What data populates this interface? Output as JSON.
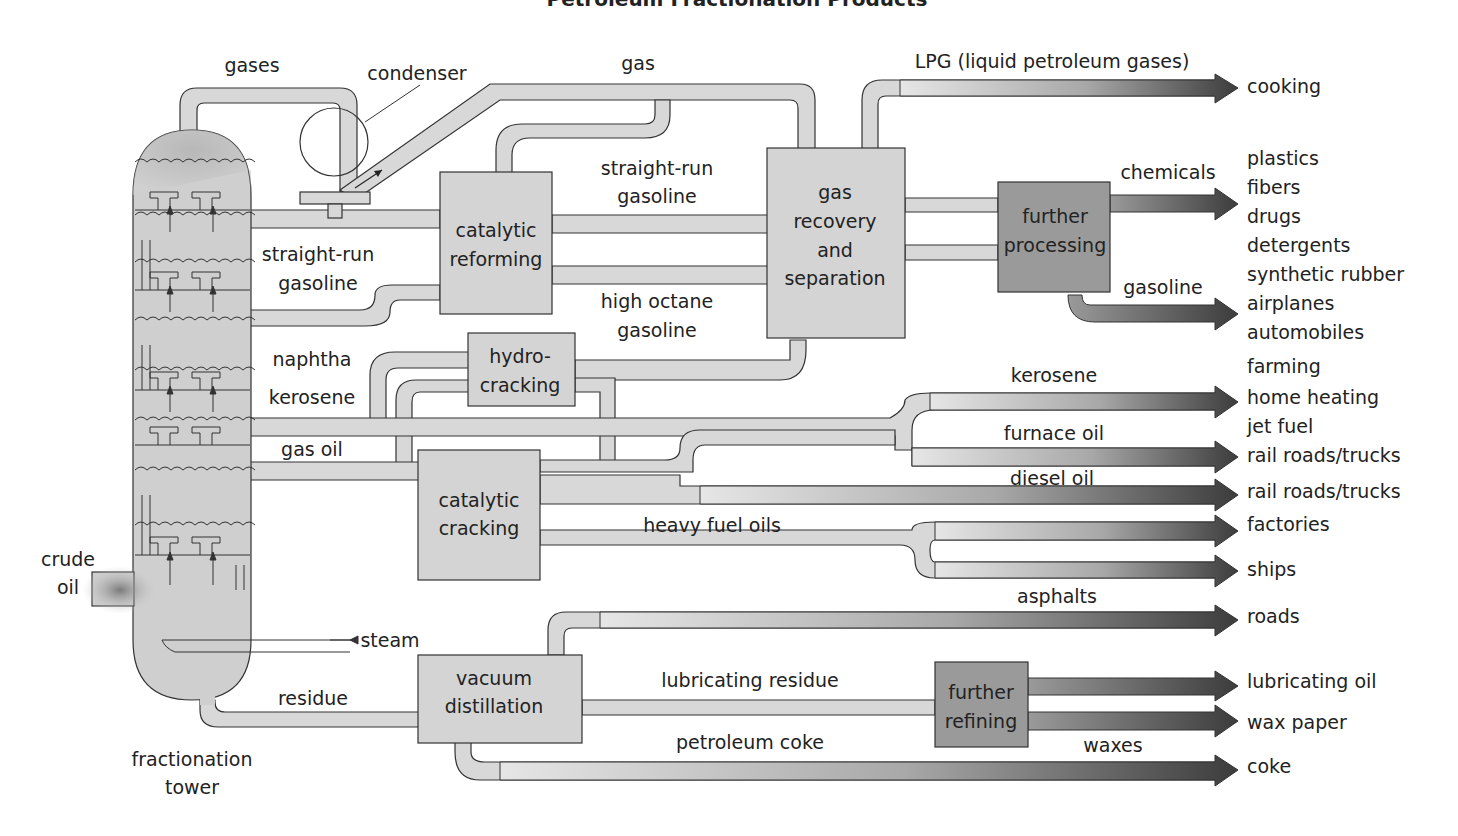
{
  "title": "Petroleum Fractionation Products",
  "tower": {
    "label_line1": "fractionation",
    "label_line2": "tower",
    "input_line1": "crude",
    "input_line2": "oil",
    "steam": "steam",
    "top_out": "gases",
    "condenser": "condenser"
  },
  "fractions": {
    "straight_run_line1": "straight-run",
    "straight_run_line2": "gasoline",
    "naphtha": "naphtha",
    "kerosene": "kerosene",
    "gas_oil": "gas oil",
    "residue": "residue"
  },
  "processes": {
    "catalytic_reforming_line1": "catalytic",
    "catalytic_reforming_line2": "reforming",
    "hydrocracking_line1": "hydro-",
    "hydrocracking_line2": "cracking",
    "catalytic_cracking_line1": "catalytic",
    "catalytic_cracking_line2": "cracking",
    "gas_recovery_line1": "gas",
    "gas_recovery_line2": "recovery",
    "gas_recovery_line3": "and",
    "gas_recovery_line4": "separation",
    "further_processing_line1": "further",
    "further_processing_line2": "processing",
    "vacuum_distillation_line1": "vacuum",
    "vacuum_distillation_line2": "distillation",
    "further_refining_line1": "further",
    "further_refining_line2": "refining"
  },
  "streams": {
    "gas": "gas",
    "srg_line1": "straight-run",
    "srg_line2": "gasoline",
    "hog_line1": "high octane",
    "hog_line2": "gasoline",
    "lpg": "LPG (liquid petroleum gases)",
    "chemicals": "chemicals",
    "gasoline": "gasoline",
    "kerosene": "kerosene",
    "furnace_oil": "furnace oil",
    "diesel_oil": "diesel oil",
    "heavy_fuel_oils": "heavy fuel oils",
    "asphalts": "asphalts",
    "lubricating_residue": "lubricating residue",
    "petroleum_coke": "petroleum coke",
    "waxes": "waxes"
  },
  "end_uses": [
    "cooking",
    "plastics",
    "fibers",
    "drugs",
    "detergents",
    "synthetic rubber",
    "airplanes",
    "automobiles",
    "farming",
    "home heating",
    "jet fuel",
    "rail roads/trucks",
    "rail roads/trucks",
    "factories",
    "ships",
    "roads",
    "lubricating oil",
    "wax paper",
    "coke"
  ]
}
